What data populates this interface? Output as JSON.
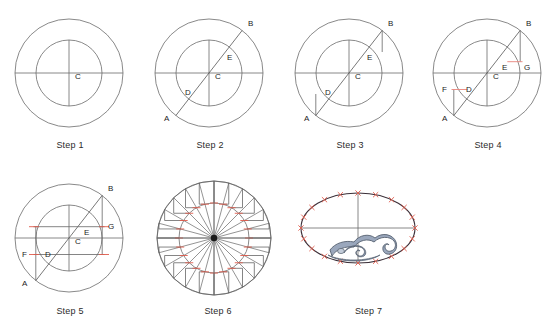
{
  "figure": {
    "background_color": "#ffffff",
    "width": 558,
    "height": 326
  },
  "palette": {
    "stroke_gray": "#6b6b6b",
    "stroke_dark": "#3b2f38",
    "construction_red": "#e8837a",
    "tick_red": "#e05b4c",
    "ornament_fill": "#9aa7bc",
    "ornament_stroke": "#55606f",
    "caption_color": "#2b2b2b"
  },
  "steps": [
    {
      "id": "step-1",
      "caption": "Step 1",
      "origin": {
        "x": 0,
        "y": 0
      },
      "center": {
        "x": 69,
        "y": 73
      },
      "outer_radius": 54,
      "inner_radius": 33,
      "point_labels": [
        {
          "name": "C",
          "text": "C",
          "x": 75,
          "y": 79
        }
      ]
    },
    {
      "id": "step-2",
      "caption": "Step 2",
      "origin": {
        "x": 140,
        "y": 0
      },
      "center": {
        "x": 69,
        "y": 73
      },
      "outer_radius": 54,
      "inner_radius": 33,
      "diagonal_angle_deg": 52,
      "point_labels": [
        {
          "name": "C",
          "text": "C",
          "x": 75,
          "y": 79
        },
        {
          "name": "A",
          "text": "A",
          "x": 24,
          "y": 121
        },
        {
          "name": "B",
          "text": "B",
          "x": 108,
          "y": 26
        },
        {
          "name": "D",
          "text": "D",
          "x": 45,
          "y": 95
        },
        {
          "name": "E",
          "text": "E",
          "x": 87,
          "y": 60
        }
      ]
    },
    {
      "id": "step-3",
      "caption": "Step 3",
      "origin": {
        "x": 280,
        "y": 0
      },
      "center": {
        "x": 69,
        "y": 73
      },
      "outer_radius": 54,
      "inner_radius": 33,
      "diagonal_angle_deg": 52,
      "point_labels": [
        {
          "name": "C",
          "text": "C",
          "x": 75,
          "y": 79
        },
        {
          "name": "A",
          "text": "A",
          "x": 24,
          "y": 121
        },
        {
          "name": "B",
          "text": "B",
          "x": 108,
          "y": 26
        },
        {
          "name": "D",
          "text": "D",
          "x": 45,
          "y": 95
        },
        {
          "name": "E",
          "text": "E",
          "x": 87,
          "y": 60
        }
      ]
    },
    {
      "id": "step-4",
      "caption": "Step 4",
      "origin": {
        "x": 418,
        "y": 0
      },
      "center": {
        "x": 69,
        "y": 73
      },
      "outer_radius": 54,
      "inner_radius": 33,
      "diagonal_angle_deg": 52,
      "point_labels": [
        {
          "name": "C",
          "text": "C",
          "x": 75,
          "y": 79
        },
        {
          "name": "A",
          "text": "A",
          "x": 24,
          "y": 121
        },
        {
          "name": "B",
          "text": "B",
          "x": 108,
          "y": 26
        },
        {
          "name": "D",
          "text": "D",
          "x": 48,
          "y": 92
        },
        {
          "name": "E",
          "text": "E",
          "x": 85,
          "y": 66
        },
        {
          "name": "F",
          "text": "F",
          "x": 26,
          "y": 96
        },
        {
          "name": "G",
          "text": "G",
          "x": 106,
          "y": 63
        }
      ]
    },
    {
      "id": "step-5",
      "caption": "Step 5",
      "origin": {
        "x": 0,
        "y": 170
      },
      "center": {
        "x": 69,
        "y": 68
      },
      "outer_radius": 54,
      "inner_radius": 33,
      "diagonal_angle_deg": 52,
      "point_labels": [
        {
          "name": "C",
          "text": "C",
          "x": 75,
          "y": 74
        },
        {
          "name": "A",
          "text": "A",
          "x": 24,
          "y": 116
        },
        {
          "name": "B",
          "text": "B",
          "x": 108,
          "y": 21
        },
        {
          "name": "D",
          "text": "D",
          "x": 48,
          "y": 87
        },
        {
          "name": "E",
          "text": "E",
          "x": 85,
          "y": 61
        },
        {
          "name": "F",
          "text": "F",
          "x": 26,
          "y": 91
        },
        {
          "name": "G",
          "text": "G",
          "x": 106,
          "y": 58
        }
      ]
    },
    {
      "id": "step-6",
      "caption": "Step 6",
      "origin": {
        "x": 148,
        "y": 170
      },
      "center": {
        "x": 66,
        "y": 68
      },
      "outer_radius": 57,
      "inner_radius": 35,
      "spoke_count": 24,
      "point_labels": []
    },
    {
      "id": "step-7",
      "caption": "Step 7",
      "origin": {
        "x": 296,
        "y": 170
      },
      "center": {
        "x": 62,
        "y": 58
      },
      "ellipse_rx": 57,
      "ellipse_ry": 35,
      "marker_count": 20,
      "ornament_label": "decorative-scroll",
      "point_labels": []
    }
  ]
}
